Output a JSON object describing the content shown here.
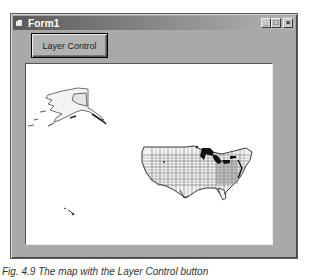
{
  "window": {
    "title": "Form1",
    "controls": {
      "minimize": "_",
      "maximize": "□",
      "close": "×"
    }
  },
  "toolbar": {
    "layer_control_label": "Layer Control"
  },
  "map": {
    "features": [
      "Alaska",
      "Hawaii",
      "Contiguous United States (state and county boundaries)",
      "Great Lakes"
    ]
  },
  "caption": {
    "text": "Fig. 4.9  The map with the Layer Control button"
  }
}
